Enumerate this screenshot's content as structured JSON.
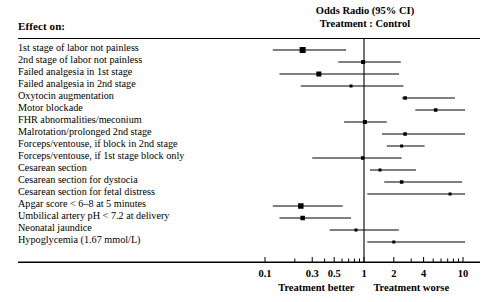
{
  "figure": {
    "effect_header": "Effect on:",
    "column_header_line1": "Odds Radio (95% CI)",
    "column_header_line2": "Treatment : Control",
    "axis_caption_left": "Treatment better",
    "axis_caption_right": "Treatment worse",
    "line_color": "#000000",
    "background": "#ffffff"
  },
  "chart_data": {
    "type": "scatter",
    "title": "Odds Radio (95% CI) Treatment : Control",
    "xlabel": "Odds Ratio (log scale)",
    "ylabel": "Effect on:",
    "xscale": "log",
    "xlim": [
      0.08,
      13
    ],
    "reference_line": 1,
    "grid": false,
    "legend": null,
    "tick_labels": [
      "0.1",
      "0.3",
      "0.5",
      "1",
      "2",
      "4",
      "10"
    ],
    "tick_values": [
      0.1,
      0.3,
      0.5,
      1,
      2,
      4,
      10
    ],
    "minor_tick_values": [
      0.1,
      0.2,
      0.3,
      0.4,
      0.5,
      0.6,
      0.7,
      0.8,
      0.9,
      1,
      2,
      3,
      4,
      5,
      6,
      7,
      8,
      9,
      10
    ],
    "annotations": [
      "Treatment better",
      "Treatment worse"
    ],
    "categories": [
      "1st stage of labor not painless",
      "2nd stage of labor not painless",
      "Failed analgesia in 1st stage",
      "Failed analgesia in 2nd stage",
      "Oxytocin augmentation",
      "Motor blockade",
      "FHR abnormalities/meconium",
      "Malrotation/prolonged 2nd stage",
      "Forceps/ventouse, if block in 2nd stage",
      "Forceps/ventouse, if 1st stage block only",
      "Cesarean section",
      "Cesarean section for dystocia",
      "Cesarean section for fetal distress",
      "Apgar score < 6–8 at 5 minutes",
      "Umbilical artery pH < 7.2 at delivery",
      "Neonatal jaundice",
      "Hypoglycemia (1.67 mmol/L)"
    ],
    "points": [
      {
        "label": "1st stage of labor not painless",
        "odds_ratio": 0.24,
        "ci_low": 0.12,
        "ci_high": 0.66,
        "marker_size": 6
      },
      {
        "label": "2nd stage of labor not painless",
        "odds_ratio": 0.98,
        "ci_low": 0.55,
        "ci_high": 2.35,
        "marker_size": 4
      },
      {
        "label": "Failed analgesia in 1st stage",
        "odds_ratio": 0.35,
        "ci_low": 0.14,
        "ci_high": 2.26,
        "marker_size": 5
      },
      {
        "label": "Failed analgesia in 2nd stage",
        "odds_ratio": 0.74,
        "ci_low": 0.23,
        "ci_high": 2.5,
        "marker_size": 3
      },
      {
        "label": "Oxytocin augmentation",
        "odds_ratio": 2.6,
        "ci_low": 2.42,
        "ci_high": 8.3,
        "marker_size": 3.5
      },
      {
        "label": "Motor blockade",
        "odds_ratio": 5.3,
        "ci_low": 3.3,
        "ci_high": 10.5,
        "marker_size": 3.5
      },
      {
        "label": "FHR abnormalities/meconium",
        "odds_ratio": 1.02,
        "ci_low": 0.63,
        "ci_high": 1.7,
        "marker_size": 4
      },
      {
        "label": "Malrotation/prolonged 2nd stage",
        "odds_ratio": 2.6,
        "ci_low": 1.52,
        "ci_high": 10.5,
        "marker_size": 3.5
      },
      {
        "label": "Forceps/ventouse, if block in 2nd stage",
        "odds_ratio": 2.4,
        "ci_low": 1.7,
        "ci_high": 4.1,
        "marker_size": 3
      },
      {
        "label": "Forceps/ventouse, if 1st stage block only",
        "odds_ratio": 0.97,
        "ci_low": 0.3,
        "ci_high": 2.4,
        "marker_size": 3.5
      },
      {
        "label": "Cesarean section",
        "odds_ratio": 1.45,
        "ci_low": 1.15,
        "ci_high": 3.35,
        "marker_size": 3
      },
      {
        "label": "Cesarean section for dystocia",
        "odds_ratio": 2.4,
        "ci_low": 1.6,
        "ci_high": 9.8,
        "marker_size": 3.5
      },
      {
        "label": "Cesarean section for fetal distress",
        "odds_ratio": 7.4,
        "ci_low": 1.08,
        "ci_high": 10.5,
        "marker_size": 3
      },
      {
        "label": "Apgar score < 6–8 at 5 minutes",
        "odds_ratio": 0.23,
        "ci_low": 0.12,
        "ci_high": 0.61,
        "marker_size": 5.5
      },
      {
        "label": "Umbilical artery pH < 7.2 at delivery",
        "odds_ratio": 0.24,
        "ci_low": 0.14,
        "ci_high": 0.74,
        "marker_size": 4.5
      },
      {
        "label": "Neonatal jaundice",
        "odds_ratio": 0.83,
        "ci_low": 0.45,
        "ci_high": 2.25,
        "marker_size": 3
      },
      {
        "label": "Hypoglycemia (1.67 mmol/L)",
        "odds_ratio": 2.0,
        "ci_low": 1.08,
        "ci_high": 10.5,
        "marker_size": 3
      }
    ]
  }
}
